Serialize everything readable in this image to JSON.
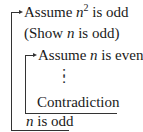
{
  "proof": {
    "outer_assumption": {
      "prefix": "Assume ",
      "var": "n",
      "exp": "2",
      "suffix": " is odd"
    },
    "goal": {
      "prefix": "(Show ",
      "var": "n",
      "suffix": " is odd)"
    },
    "inner_assumption": {
      "prefix": "Assume ",
      "var": "n",
      "suffix": " is even"
    },
    "ellipsis": ":",
    "inner_conclusion": "Contradiction",
    "outer_conclusion": {
      "var": "n",
      "suffix": " is odd"
    }
  },
  "colors": {
    "line": "#333333",
    "text": "#1a1a1a",
    "background": "#ffffff"
  }
}
